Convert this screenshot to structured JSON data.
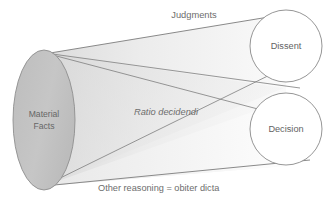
{
  "diagram": {
    "type": "cone-funnel",
    "title_label": "Judgments",
    "body_label": "Ratio decidendi",
    "caption_plain": "Other reasoning = ",
    "caption_italic": "obiter dicta",
    "source_node": {
      "line1": "Material",
      "line2": "Facts"
    },
    "outcome_nodes": [
      {
        "label": "Dissent"
      },
      {
        "label": "Decision"
      }
    ],
    "colors": {
      "background": "#ffffff",
      "ellipse_fill": "#c2c2c2",
      "ellipse_stroke": "#8e8e8e",
      "cone_fill_light": "#efefef",
      "cone_fill_lighter": "#f7f7f7",
      "wedge_fill": "#e4e4e4",
      "line_stroke": "#7d7d7d",
      "circle_stroke": "#8a8a8a",
      "circle_fill": "#ffffff",
      "text": "#6d6d6d"
    }
  }
}
